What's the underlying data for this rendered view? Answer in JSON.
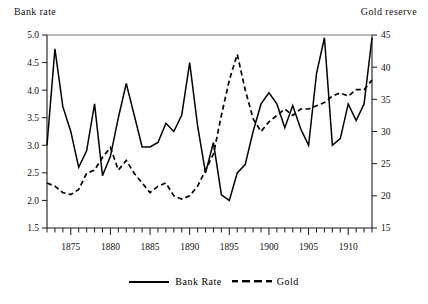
{
  "figure": {
    "left_axis_title": "Bank rate",
    "right_axis_title": "Gold reserve"
  },
  "legend": {
    "entries": [
      {
        "label": "Bank Rate",
        "style": "solid"
      },
      {
        "label": "Gold",
        "style": "dashed"
      }
    ]
  },
  "chart_data": {
    "type": "line",
    "title": "",
    "xlabel": "",
    "ylabel": "Bank rate",
    "y2label": "Gold reserve",
    "xlim": [
      1872,
      1913
    ],
    "ylim": [
      1.5,
      5.0
    ],
    "y2lim": [
      15,
      45
    ],
    "grid": false,
    "legend_position": "bottom-center",
    "xticks": [
      1875,
      1880,
      1885,
      1890,
      1895,
      1900,
      1905,
      1910
    ],
    "xtick_labels": [
      "1875",
      "1880",
      "1885",
      "1890",
      "1895",
      "1900",
      "1905",
      "1910"
    ],
    "xminor_tick_step": 1,
    "yticks": [
      1.5,
      2.0,
      2.5,
      3.0,
      3.5,
      4.0,
      4.5,
      5.0
    ],
    "ytick_labels": [
      "1.5",
      "2.0",
      "2.5",
      "3.0",
      "3.5",
      "4.0",
      "4.5",
      "5.0"
    ],
    "y2ticks": [
      15,
      20,
      25,
      30,
      35,
      40,
      45
    ],
    "y2tick_labels": [
      "15",
      "20",
      "25",
      "30",
      "35",
      "40",
      "45"
    ],
    "x": [
      1872,
      1873,
      1874,
      1875,
      1876,
      1877,
      1878,
      1879,
      1880,
      1881,
      1882,
      1883,
      1884,
      1885,
      1886,
      1887,
      1888,
      1889,
      1890,
      1891,
      1892,
      1893,
      1894,
      1895,
      1896,
      1897,
      1898,
      1899,
      1900,
      1901,
      1902,
      1903,
      1904,
      1905,
      1906,
      1907,
      1908,
      1909,
      1910,
      1911,
      1912,
      1913
    ],
    "series": [
      {
        "name": "Bank Rate",
        "axis": "left",
        "style": "solid",
        "values": [
          3.0,
          4.75,
          3.7,
          3.25,
          2.6,
          2.9,
          3.75,
          2.45,
          2.8,
          3.5,
          4.12,
          3.55,
          2.97,
          2.97,
          3.05,
          3.4,
          3.25,
          3.55,
          4.5,
          3.35,
          2.5,
          3.05,
          2.1,
          2.0,
          2.5,
          2.65,
          3.25,
          3.75,
          3.95,
          3.75,
          3.32,
          3.72,
          3.3,
          3.0,
          4.3,
          4.95,
          3.0,
          3.12,
          3.75,
          3.45,
          3.75,
          4.95
        ]
      },
      {
        "name": "Gold",
        "axis": "right",
        "style": "dashed",
        "values": [
          22.0,
          21.5,
          20.5,
          20.2,
          21.0,
          23.5,
          24.0,
          26.0,
          27.5,
          24.0,
          25.5,
          23.5,
          22.0,
          20.5,
          21.5,
          22.0,
          20.0,
          19.5,
          20.0,
          21.5,
          24.0,
          26.5,
          32.5,
          38.0,
          42.0,
          36.5,
          32.0,
          30.0,
          31.5,
          32.5,
          33.5,
          32.5,
          33.5,
          33.5,
          34.0,
          34.5,
          35.5,
          36.0,
          35.5,
          36.5,
          36.5,
          38.0
        ]
      }
    ]
  }
}
